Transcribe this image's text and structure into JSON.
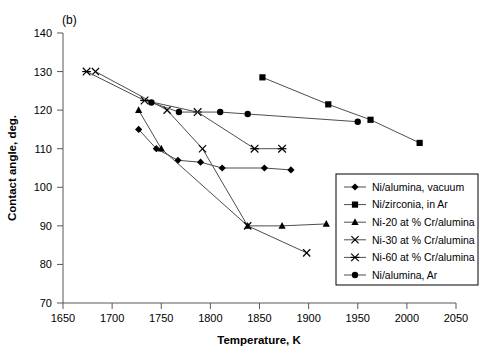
{
  "panel": {
    "label": "(b)"
  },
  "chart_data": {
    "type": "line",
    "title": "",
    "subtitle": "",
    "panel_label": "(b)",
    "xlabel": "Temperature, K",
    "ylabel": "Contact angle, deg.",
    "xlim": [
      1650,
      2050
    ],
    "ylim": [
      70,
      140
    ],
    "xticks": [
      1650,
      1700,
      1750,
      1800,
      1850,
      1900,
      1950,
      2000,
      2050
    ],
    "yticks": [
      70,
      80,
      90,
      100,
      110,
      120,
      130,
      140
    ],
    "grid": false,
    "legend_position": "lower-right-inside",
    "series": [
      {
        "name": "Ni/alumina, vacuum",
        "marker": "diamond",
        "points": [
          [
            1727,
            115.0
          ],
          [
            1745,
            110.0
          ],
          [
            1767,
            107.0
          ],
          [
            1790,
            106.5
          ],
          [
            1812,
            105.0
          ],
          [
            1855,
            105.0
          ],
          [
            1882,
            104.5
          ]
        ]
      },
      {
        "name": "Ni/zirconia, in Ar",
        "marker": "square",
        "points": [
          [
            1853,
            128.5
          ],
          [
            1920,
            121.5
          ],
          [
            1963,
            117.5
          ],
          [
            2013,
            111.5
          ]
        ]
      },
      {
        "name": "Ni-20 at % Cr/alumina",
        "marker": "triangle",
        "points": [
          [
            1727,
            120.0
          ],
          [
            1750,
            110.0
          ],
          [
            1838,
            90.0
          ],
          [
            1873,
            90.0
          ],
          [
            1918,
            90.5
          ]
        ]
      },
      {
        "name": "Ni-30 at % Cr/alumina",
        "marker": "x",
        "points": [
          [
            1683,
            130.0
          ],
          [
            1756,
            120.0
          ],
          [
            1792,
            110.0
          ],
          [
            1838,
            90.0
          ],
          [
            1898,
            83.0
          ]
        ]
      },
      {
        "name": "Ni-60 at % Cr/alumina",
        "marker": "star",
        "points": [
          [
            1674,
            130.0
          ],
          [
            1733,
            122.5
          ],
          [
            1787,
            119.5
          ],
          [
            1845,
            110.0
          ],
          [
            1873,
            110.0
          ]
        ]
      },
      {
        "name": "Ni/alumina, Ar",
        "marker": "circle",
        "points": [
          [
            1740,
            122.0
          ],
          [
            1768,
            119.5
          ],
          [
            1810,
            119.5
          ],
          [
            1838,
            119.0
          ],
          [
            1950,
            117.0
          ]
        ]
      }
    ]
  },
  "legend": {
    "entries": [
      {
        "label": "Ni/alumina, vacuum",
        "marker": "diamond"
      },
      {
        "label": "Ni/zirconia, in Ar",
        "marker": "square"
      },
      {
        "label": "Ni-20 at % Cr/alumina",
        "marker": "triangle"
      },
      {
        "label": "Ni-30 at % Cr/alumina",
        "marker": "x"
      },
      {
        "label": "Ni-60 at % Cr/alumina",
        "marker": "star"
      },
      {
        "label": "Ni/alumina, Ar",
        "marker": "circle"
      }
    ]
  },
  "axes": {
    "x_title": "Temperature, K",
    "y_title": "Contact angle, deg.",
    "x_ticks": [
      "1650",
      "1700",
      "1750",
      "1800",
      "1850",
      "1900",
      "1950",
      "2000",
      "2050"
    ],
    "y_ticks": [
      "70",
      "80",
      "90",
      "100",
      "110",
      "120",
      "130",
      "140"
    ]
  },
  "colors": {
    "axis": "#595959",
    "line": "#4d4d4d",
    "marker": "#000000",
    "background": "#ffffff"
  }
}
